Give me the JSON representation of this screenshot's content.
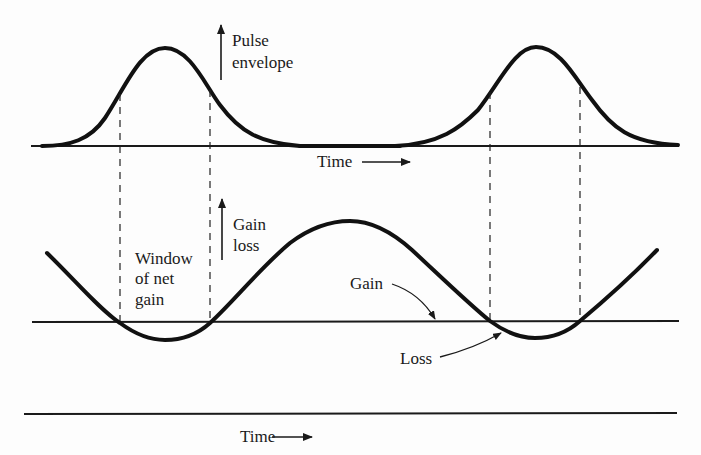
{
  "diagram": {
    "top_panel": {
      "y_label_line1": "Pulse",
      "y_label_line2": "envelope",
      "x_label": "Time",
      "series": "pulse envelope (two periodic Gaussian-like pulses)"
    },
    "middle_panel": {
      "y_label_line1": "Gain",
      "y_label_line2": "loss",
      "window_label_line1": "Window",
      "window_label_line2": "of net",
      "window_label_line3": "gain",
      "gain_label": "Gain",
      "loss_label": "Loss"
    },
    "bottom_axis": {
      "x_label": "Time"
    },
    "colors": {
      "ink": "#111111",
      "background": "#fdfdfd"
    }
  }
}
